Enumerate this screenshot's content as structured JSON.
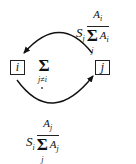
{
  "diagram": {
    "nodes": [
      {
        "id": "i",
        "label": "i"
      },
      {
        "id": "j",
        "label": "j"
      }
    ],
    "center_sum": {
      "symbol": "Σ",
      "subscript": "j≠i"
    },
    "edges": [
      {
        "from": "j",
        "to": "i",
        "position": "top",
        "label": {
          "coef": "S",
          "coef_sub": "j",
          "numerator": "A",
          "numerator_sub": "i",
          "sum_symbol": "Σ",
          "sum_sub": "j",
          "denominator": "A",
          "denominator_sub": "i"
        }
      },
      {
        "from": "i",
        "to": "j",
        "position": "bottom",
        "label": {
          "coef": "S",
          "coef_sub": "i",
          "numerator": "A",
          "numerator_sub": "j",
          "sum_symbol": "Σ",
          "sum_sub": "j",
          "denominator": "A",
          "denominator_sub": "j"
        }
      }
    ],
    "colors": {
      "stroke": "#111111",
      "background": "#ffffff"
    }
  }
}
